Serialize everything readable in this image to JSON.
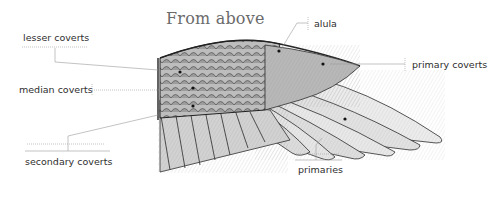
{
  "title": "From above",
  "labels": {
    "lesser_coverts": "lesser coverts",
    "median_coverts": "median coverts",
    "secondary_coverts": "secondary coverts",
    "alula": "alula",
    "primary_coverts": "primary coverts",
    "primaries": "primaries"
  },
  "colors": {
    "title": "#6b6b6b",
    "label_text": "#2e2e2e",
    "leader_line": "#9a9a9a",
    "ink": "#2a2a2a",
    "feather_fill": "#e4e4e4"
  }
}
